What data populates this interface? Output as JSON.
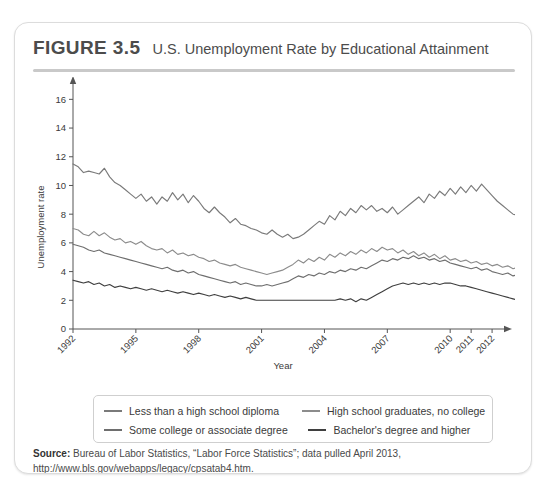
{
  "figure": {
    "number": "FIGURE 3.5",
    "title": "U.S. Unemployment Rate by Educational Attainment"
  },
  "legend": {
    "items": [
      {
        "label": "Less than a high school diploma",
        "color": "#7a7a7a"
      },
      {
        "label": "High school graduates, no college",
        "color": "#8c8c8c"
      },
      {
        "label": "Some college or associate degree",
        "color": "#6e6e6e"
      },
      {
        "label": "Bachelor's degree and higher",
        "color": "#3f3f3f"
      }
    ]
  },
  "source": {
    "label": "Source:",
    "text": " Bureau of Labor Statistics, “Labor Force Statistics”; data pulled April 2013, http://www.bls.gov/webapps/legacy/cpsatab4.htm."
  },
  "chart_data": {
    "type": "line",
    "title": "U.S. Unemployment Rate by Educational Attainment",
    "xlabel": "Year",
    "ylabel": "Unemployment rate",
    "xlim": [
      1992,
      2012.33
    ],
    "ylim": [
      0,
      17
    ],
    "yticks": [
      0,
      2,
      4,
      6,
      8,
      10,
      12,
      14,
      16
    ],
    "xticks": [
      1992,
      1995,
      1998,
      2001,
      2004,
      2007,
      2010,
      2011,
      2012
    ],
    "xtick_labels": [
      "1992",
      "1995",
      "1998",
      "2001",
      "2004",
      "2007",
      "2010",
      "2011",
      "2012"
    ],
    "grid": false,
    "legend_position": "below-plot",
    "x_start": 1992.0,
    "x_step": 0.25,
    "series": [
      {
        "name": "Less than a high school diploma",
        "color": "#7a7a7a",
        "values": [
          11.5,
          11.3,
          10.9,
          11.0,
          10.9,
          10.8,
          11.2,
          10.6,
          10.2,
          10.0,
          9.7,
          9.4,
          9.1,
          9.4,
          8.9,
          9.2,
          8.7,
          9.2,
          8.9,
          9.5,
          9.0,
          9.4,
          8.8,
          9.3,
          8.9,
          8.4,
          8.1,
          8.5,
          8.1,
          7.8,
          7.4,
          7.7,
          7.3,
          7.2,
          7.0,
          6.9,
          6.7,
          6.6,
          6.9,
          6.6,
          6.4,
          6.6,
          6.3,
          6.4,
          6.6,
          6.9,
          7.2,
          7.5,
          7.3,
          7.9,
          7.6,
          8.2,
          7.9,
          8.4,
          8.1,
          8.6,
          8.3,
          8.6,
          8.2,
          8.4,
          8.1,
          8.5,
          8.0,
          8.3,
          8.6,
          8.9,
          9.2,
          8.8,
          9.4,
          9.1,
          9.6,
          9.3,
          9.8,
          9.4,
          9.9,
          9.5,
          10.0,
          9.6,
          10.1,
          9.7,
          9.3,
          8.9,
          8.6,
          8.3,
          8.0,
          7.9,
          8.2,
          7.8,
          7.6,
          7.4,
          7.8,
          8.1,
          8.4,
          8.9,
          9.4,
          10.2,
          11.1,
          12.3,
          13.5,
          14.4,
          15.2,
          15.6,
          15.8,
          15.8,
          15.7,
          14.6,
          15.6,
          14.8,
          14.0,
          13.6,
          13.2,
          13.0,
          12.8,
          12.6,
          12.5,
          12.4,
          12.3
        ]
      },
      {
        "name": "High school graduates, no college",
        "color": "#8c8c8c",
        "values": [
          7.0,
          6.9,
          6.6,
          6.5,
          6.8,
          6.5,
          6.7,
          6.4,
          6.2,
          6.3,
          6.0,
          6.1,
          5.9,
          6.1,
          5.8,
          5.6,
          5.5,
          5.6,
          5.3,
          5.5,
          5.2,
          5.3,
          5.1,
          5.2,
          5.0,
          4.9,
          4.7,
          4.8,
          4.6,
          4.5,
          4.4,
          4.5,
          4.3,
          4.2,
          4.1,
          4.0,
          3.9,
          3.8,
          3.9,
          4.0,
          4.1,
          4.3,
          4.5,
          4.8,
          4.6,
          4.9,
          4.7,
          5.0,
          4.8,
          5.2,
          5.0,
          5.3,
          5.1,
          5.4,
          5.2,
          5.5,
          5.3,
          5.6,
          5.4,
          5.7,
          5.5,
          5.6,
          5.3,
          5.5,
          5.2,
          5.4,
          5.1,
          5.3,
          5.0,
          5.2,
          4.9,
          5.1,
          4.8,
          4.9,
          4.7,
          4.8,
          4.6,
          4.7,
          4.5,
          4.6,
          4.4,
          4.5,
          4.3,
          4.4,
          4.2,
          4.3,
          4.5,
          4.4,
          4.6,
          4.5,
          4.7,
          4.9,
          5.1,
          5.4,
          5.8,
          6.3,
          7.0,
          7.8,
          8.6,
          9.3,
          9.8,
          10.2,
          10.4,
          10.5,
          10.3,
          9.8,
          11.0,
          10.1,
          9.6,
          9.4,
          9.2,
          9.0,
          8.8,
          8.7,
          8.6,
          8.5,
          8.4
        ]
      },
      {
        "name": "Some college or associate degree",
        "color": "#6e6e6e",
        "values": [
          5.9,
          5.8,
          5.7,
          5.5,
          5.4,
          5.5,
          5.3,
          5.2,
          5.1,
          5.0,
          4.9,
          4.8,
          4.7,
          4.6,
          4.5,
          4.4,
          4.3,
          4.2,
          4.3,
          4.1,
          4.0,
          4.1,
          3.9,
          4.0,
          3.8,
          3.7,
          3.6,
          3.5,
          3.4,
          3.3,
          3.2,
          3.3,
          3.1,
          3.2,
          3.1,
          3.0,
          3.0,
          3.1,
          3.0,
          3.1,
          3.2,
          3.3,
          3.5,
          3.7,
          3.6,
          3.8,
          3.7,
          3.9,
          3.8,
          4.0,
          3.9,
          4.1,
          4.0,
          4.2,
          4.1,
          4.3,
          4.2,
          4.4,
          4.6,
          4.8,
          4.7,
          4.9,
          4.8,
          5.0,
          4.9,
          5.1,
          4.9,
          5.0,
          4.8,
          4.9,
          4.7,
          4.8,
          4.6,
          4.5,
          4.4,
          4.3,
          4.2,
          4.3,
          4.1,
          4.2,
          4.0,
          3.9,
          3.8,
          3.9,
          3.7,
          3.8,
          3.6,
          3.7,
          3.8,
          3.7,
          3.9,
          4.0,
          4.2,
          4.4,
          4.7,
          5.1,
          5.6,
          6.2,
          6.8,
          7.3,
          7.7,
          8.0,
          8.2,
          8.3,
          8.1,
          7.8,
          9.0,
          8.0,
          7.6,
          7.4,
          7.3,
          7.2,
          7.1,
          7.1,
          7.0,
          7.0,
          7.0
        ]
      },
      {
        "name": "Bachelor's degree and higher",
        "color": "#3f3f3f",
        "values": [
          3.4,
          3.3,
          3.2,
          3.3,
          3.1,
          3.2,
          3.0,
          3.1,
          2.9,
          3.0,
          2.9,
          2.8,
          2.9,
          2.8,
          2.7,
          2.8,
          2.7,
          2.6,
          2.7,
          2.6,
          2.5,
          2.6,
          2.5,
          2.4,
          2.5,
          2.4,
          2.3,
          2.4,
          2.3,
          2.2,
          2.3,
          2.2,
          2.1,
          2.2,
          2.1,
          2.0,
          2.0,
          2.0,
          2.0,
          2.0,
          2.0,
          2.0,
          2.0,
          2.0,
          2.0,
          2.0,
          2.0,
          2.0,
          2.0,
          2.0,
          2.0,
          2.1,
          2.0,
          2.1,
          1.9,
          2.1,
          2.0,
          2.2,
          2.4,
          2.6,
          2.8,
          3.0,
          3.1,
          3.2,
          3.1,
          3.2,
          3.1,
          3.2,
          3.1,
          3.2,
          3.1,
          3.2,
          3.2,
          3.1,
          3.0,
          3.0,
          2.9,
          2.8,
          2.7,
          2.6,
          2.5,
          2.4,
          2.3,
          2.2,
          2.1,
          2.0,
          2.1,
          2.0,
          2.1,
          2.0,
          2.1,
          2.2,
          2.3,
          2.4,
          2.6,
          2.8,
          3.1,
          3.4,
          3.7,
          4.0,
          4.3,
          4.6,
          4.8,
          4.9,
          4.9,
          4.7,
          5.0,
          4.6,
          4.4,
          4.3,
          4.2,
          4.2,
          4.1,
          4.1,
          4.0,
          4.0,
          4.0
        ]
      }
    ]
  }
}
